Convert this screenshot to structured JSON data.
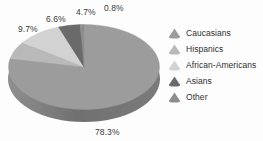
{
  "chart_data": {
    "type": "pie",
    "title": "",
    "categories": [
      "Caucasians",
      "Hispanics",
      "African-Americans",
      "Asians",
      "Other"
    ],
    "values": [
      78.3,
      6.6,
      9.7,
      4.7,
      0.8
    ],
    "value_labels": [
      "78.3%",
      "6.6%",
      "9.7%",
      "4.7%",
      "0.8%"
    ],
    "unit": "%",
    "legend_position": "right",
    "grid": false,
    "three_d": true,
    "colors": [
      "#9c9c9c",
      "#b9b9b9",
      "#d2d2d2",
      "#6a6a6a",
      "#8d8d8d"
    ],
    "side_color": "#7d7d7d"
  },
  "labels": {
    "caucasians_pct": "78.3%",
    "hispanics_pct": "6.6%",
    "african_americans_pct": "9.7%",
    "asians_pct": "4.7%",
    "other_pct": "0.8%"
  },
  "legend": {
    "items": [
      {
        "label": "Caucasians",
        "color": "#9c9c9c",
        "marker": "cone-icon"
      },
      {
        "label": "Hispanics",
        "color": "#b9b9b9",
        "marker": "cone-icon"
      },
      {
        "label": "African-Americans",
        "color": "#d2d2d2",
        "marker": "cone-icon"
      },
      {
        "label": "Asians",
        "color": "#6a6a6a",
        "marker": "cone-icon"
      },
      {
        "label": "Other",
        "color": "#8d8d8d",
        "marker": "cone-icon"
      }
    ]
  }
}
